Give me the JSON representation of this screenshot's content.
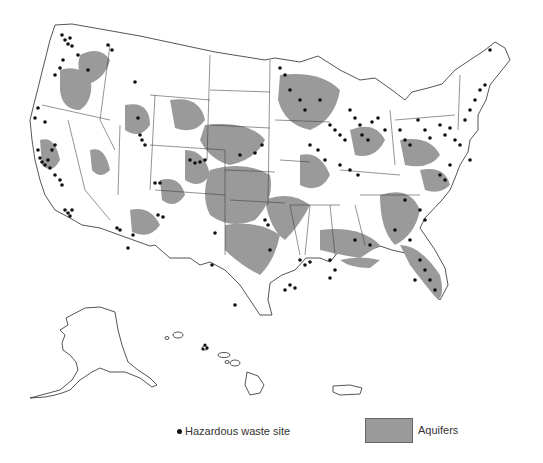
{
  "map": {
    "title": "Hazardous waste sites and aquifers of the United States",
    "aquifer_color": "#9a9a9a",
    "site_color": "#111111",
    "regions": [
      "Contiguous United States",
      "Alaska",
      "Hawaii",
      "Puerto Rico"
    ]
  },
  "legend": {
    "site_label": "Hazardous waste site",
    "aquifer_label": "Aquifers"
  }
}
